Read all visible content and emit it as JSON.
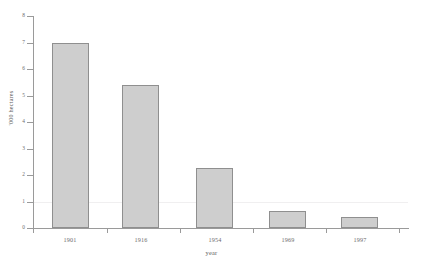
{
  "chart_data": {
    "type": "bar",
    "title": "",
    "subtitle": "",
    "xlabel": "year",
    "ylabel": "'000 hectares",
    "categories": [
      "1901",
      "1916",
      "1954",
      "1969",
      "1997"
    ],
    "values": [
      7.0,
      5.4,
      2.25,
      0.65,
      0.4
    ],
    "series": [
      {
        "name": "area",
        "values": [
          7.0,
          5.4,
          2.25,
          0.65,
          0.4
        ]
      }
    ],
    "ylim": [
      0,
      8
    ],
    "xlim_categories": 5,
    "y_ticks": [
      0,
      1,
      2,
      3,
      4,
      5,
      6,
      7,
      8
    ],
    "y_tick_labels": [
      "0",
      "1",
      "2",
      "3",
      "4",
      "5",
      "6",
      "7",
      "8"
    ],
    "x_tick_labels": [
      "1901",
      "1916",
      "1954",
      "1969",
      "1997"
    ],
    "grid": "single faint horizontal gridline at y=1",
    "gridlines_y": [
      1
    ],
    "legend": null,
    "legend_position": "none",
    "annotations": [],
    "colors": {
      "bar_fill": "#cecece",
      "bar_border": "#8f8f8f",
      "axis": "#9a9a9a",
      "text": "#6d6d6d",
      "gridline": "#f0eff0",
      "background": "#ffffff"
    }
  },
  "axes": {
    "y_title": "'000 hectares",
    "x_title": "year"
  }
}
